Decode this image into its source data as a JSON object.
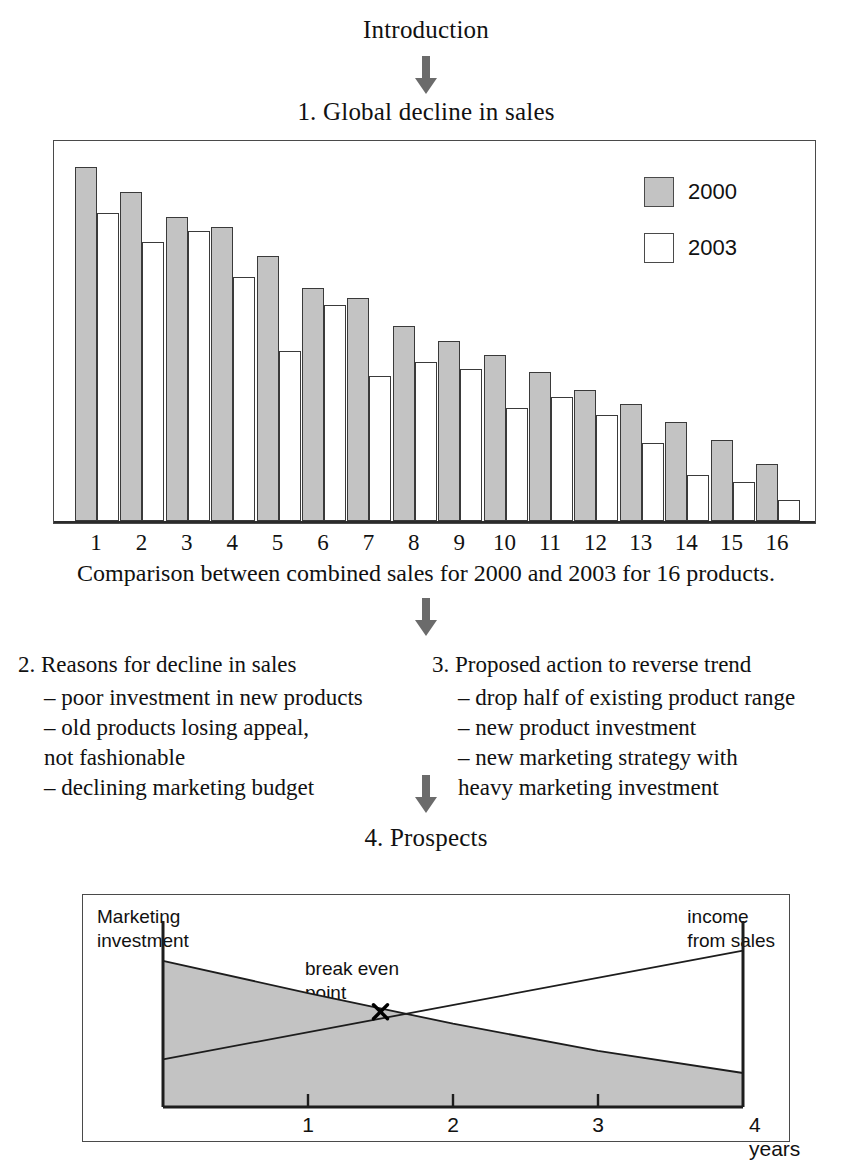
{
  "flow": {
    "intro_title": "Introduction",
    "section1_title": "1. Global decline in sales",
    "chart1_caption": "Comparison between combined sales for 2000 and 2003 for 16 products.",
    "section4_title": "4. Prospects"
  },
  "sections": {
    "reasons": {
      "title": "2. Reasons for decline in sales",
      "items": [
        "– poor investment in new products",
        "– old products losing appeal,",
        "   not fashionable",
        "– declining marketing budget"
      ]
    },
    "actions": {
      "title": "3. Proposed action to reverse trend",
      "items": [
        "– drop half of existing product range",
        "– new product investment",
        "– new marketing strategy with",
        "   heavy marketing investment"
      ]
    }
  },
  "chart_data": [
    {
      "type": "bar",
      "title": "1. Global decline in sales",
      "caption": "Comparison between combined sales for 2000 and 2003 for 16 products.",
      "categories": [
        "1",
        "2",
        "3",
        "4",
        "5",
        "6",
        "7",
        "8",
        "9",
        "10",
        "11",
        "12",
        "13",
        "14",
        "15",
        "16"
      ],
      "series": [
        {
          "name": "2000",
          "color": "#c3c3c3",
          "values": [
            100,
            93,
            86,
            83,
            75,
            66,
            63,
            55,
            51,
            47,
            42,
            37,
            33,
            28,
            23,
            16
          ]
        },
        {
          "name": "2003",
          "color": "#ffffff",
          "values": [
            87,
            79,
            82,
            69,
            48,
            61,
            41,
            45,
            43,
            32,
            35,
            30,
            22,
            13,
            11,
            6
          ]
        }
      ],
      "legend": [
        "2000",
        "2003"
      ],
      "legend_position": "top-right",
      "xlabel": "",
      "ylabel": "",
      "ylim": [
        0,
        108
      ],
      "grid": false
    },
    {
      "type": "area",
      "title": "4. Prospects",
      "annotations": [
        "break even point"
      ],
      "axis_labels": {
        "left": "Marketing\ninvestment",
        "right": "income\nfrom sales"
      },
      "left_label_line1": "Marketing",
      "left_label_line2": "investment",
      "right_label_line1": "income",
      "right_label_line2": "from sales",
      "break_even_label_line1": "break even",
      "break_even_label_line2": "point",
      "x_ticks": [
        "1",
        "2",
        "3"
      ],
      "x_end_label": "4 years",
      "xlim": [
        0,
        4
      ],
      "series": [
        {
          "name": "marketing investment",
          "x": [
            0,
            1,
            2,
            3,
            4
          ],
          "y": [
            86,
            67,
            49,
            33,
            20
          ]
        },
        {
          "name": "income from sales",
          "x": [
            0,
            4
          ],
          "y": [
            28,
            92
          ]
        }
      ],
      "break_even": {
        "x": 1.5,
        "y": 56
      },
      "fill_color": "#c3c3c3"
    }
  ],
  "colors": {
    "bar_2000": "#c3c3c3",
    "bar_2003": "#ffffff",
    "stroke": "#3a3a3a",
    "frame": "#4a4a4a",
    "arrow": "#6b6b6b",
    "text": "#111111"
  }
}
